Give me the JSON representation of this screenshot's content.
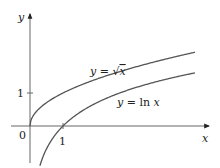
{
  "chart_data": {
    "type": "line",
    "title": "",
    "xlabel": "x",
    "ylabel": "y",
    "origin_label": "0",
    "x_ticks": [
      {
        "value": 1,
        "label": "1"
      }
    ],
    "y_ticks": [
      {
        "value": 1,
        "label": "1"
      }
    ],
    "xlim": [
      -0.9,
      5.6
    ],
    "ylim": [
      -1.2,
      2.6
    ],
    "grid": false,
    "series": [
      {
        "name": "y = √x",
        "label_prefix": "y = ",
        "label_func": "√x",
        "function": "sqrt(x)",
        "domain": [
          0,
          5
        ],
        "color": "#555555"
      },
      {
        "name": "y = ln x",
        "label_prefix": "y = ",
        "label_func": "ln x",
        "function": "ln(x)",
        "domain": [
          0.3,
          5
        ],
        "color": "#555555"
      }
    ]
  },
  "labels": {
    "sqrt_curve": "y = √x",
    "ln_curve": "y = ln x"
  }
}
